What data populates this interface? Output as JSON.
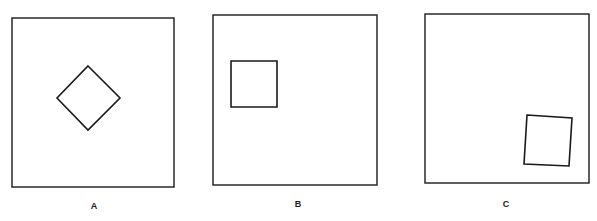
{
  "figure": {
    "stroke_color": "#1a1a1a",
    "background": "#ffffff",
    "panels": [
      {
        "label": "A",
        "frame": {
          "x": 12,
          "y": 18,
          "w": 162,
          "h": 169
        },
        "inner_shape": "diamond",
        "inner_points": "88,66 120,98 88,130 57,98",
        "label_pos": {
          "x": 94,
          "y": 202
        }
      },
      {
        "label": "B",
        "frame": {
          "x": 213,
          "y": 15,
          "w": 164,
          "h": 170
        },
        "inner_shape": "square",
        "inner_points": "231,61 277,61 277,107 231,107",
        "label_pos": {
          "x": 298,
          "y": 200
        }
      },
      {
        "label": "C",
        "frame": {
          "x": 425,
          "y": 14,
          "w": 164,
          "h": 169
        },
        "inner_shape": "tilted-square",
        "inner_points": "527,115 572,118 569,166 524,164",
        "label_pos": {
          "x": 506,
          "y": 200
        }
      }
    ]
  }
}
